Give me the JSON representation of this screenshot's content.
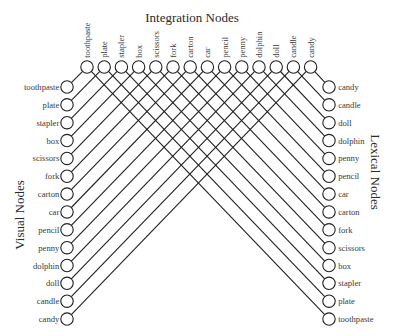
{
  "diagram": {
    "title_top": "Integration Nodes",
    "title_left": "Visual Nodes",
    "title_right": "Lexical Nodes",
    "integration_nodes": [
      "toothpaste",
      "plate",
      "stapler",
      "box",
      "scissors",
      "fork",
      "carton",
      "car",
      "pencil",
      "penny",
      "dolphin",
      "doll",
      "candle",
      "candy"
    ],
    "visual_nodes": [
      "toothpaste",
      "plate",
      "stapler",
      "box",
      "scissors",
      "fork",
      "carton",
      "car",
      "pencil",
      "penny",
      "dolphin",
      "doll",
      "candle",
      "candy"
    ],
    "lexical_nodes": [
      "candy",
      "candle",
      "doll",
      "dolphin",
      "penny",
      "pencil",
      "car",
      "carton",
      "fork",
      "scissors",
      "box",
      "stapler",
      "plate",
      "toothpaste"
    ],
    "connections": "Each integration node connects to the visual node and the lexical node with the same label",
    "colors": {
      "line": "#1f1f1f",
      "node_fill": "#ffffff",
      "text": "#3a3a3a"
    }
  }
}
